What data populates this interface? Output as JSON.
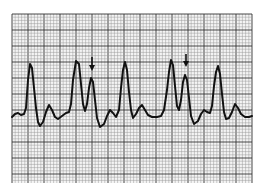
{
  "figure": {
    "paper_color": "#f4f4f4",
    "minor_grid_color": "#9a9a9a",
    "major_grid_color": "#333333",
    "trace_color": "#111111",
    "arrows": [
      {
        "x": 92,
        "y_top": 57,
        "y_tip": 71
      },
      {
        "x": 186,
        "y_top": 54,
        "y_tip": 67
      }
    ],
    "trace_points": [
      [
        12,
        117
      ],
      [
        15,
        114
      ],
      [
        18,
        113
      ],
      [
        21,
        115
      ],
      [
        24,
        114
      ],
      [
        26,
        108
      ],
      [
        28,
        80
      ],
      [
        30,
        64
      ],
      [
        32,
        68
      ],
      [
        34,
        88
      ],
      [
        36,
        108
      ],
      [
        38,
        122
      ],
      [
        40,
        126
      ],
      [
        43,
        122
      ],
      [
        46,
        112
      ],
      [
        49,
        105
      ],
      [
        52,
        110
      ],
      [
        55,
        117
      ],
      [
        58,
        119
      ],
      [
        62,
        116
      ],
      [
        66,
        113
      ],
      [
        69,
        112
      ],
      [
        71,
        104
      ],
      [
        73,
        80
      ],
      [
        76,
        61
      ],
      [
        79,
        64
      ],
      [
        81,
        84
      ],
      [
        83,
        104
      ],
      [
        85,
        111
      ],
      [
        87,
        104
      ],
      [
        89,
        88
      ],
      [
        91,
        78
      ],
      [
        93,
        82
      ],
      [
        95,
        100
      ],
      [
        97,
        118
      ],
      [
        100,
        127
      ],
      [
        104,
        124
      ],
      [
        107,
        116
      ],
      [
        110,
        110
      ],
      [
        113,
        113
      ],
      [
        116,
        117
      ],
      [
        119,
        110
      ],
      [
        121,
        88
      ],
      [
        123,
        70
      ],
      [
        125,
        62
      ],
      [
        127,
        70
      ],
      [
        129,
        92
      ],
      [
        131,
        110
      ],
      [
        133,
        118
      ],
      [
        136,
        114
      ],
      [
        139,
        108
      ],
      [
        142,
        105
      ],
      [
        145,
        110
      ],
      [
        148,
        115
      ],
      [
        152,
        117
      ],
      [
        157,
        117
      ],
      [
        161,
        116
      ],
      [
        164,
        110
      ],
      [
        167,
        90
      ],
      [
        169,
        72
      ],
      [
        171,
        60
      ],
      [
        173,
        65
      ],
      [
        175,
        86
      ],
      [
        177,
        106
      ],
      [
        179,
        110
      ],
      [
        181,
        100
      ],
      [
        183,
        82
      ],
      [
        185,
        75
      ],
      [
        187,
        80
      ],
      [
        189,
        98
      ],
      [
        191,
        116
      ],
      [
        194,
        124
      ],
      [
        198,
        121
      ],
      [
        201,
        114
      ],
      [
        204,
        110
      ],
      [
        207,
        112
      ],
      [
        210,
        113
      ],
      [
        212,
        106
      ],
      [
        214,
        86
      ],
      [
        216,
        72
      ],
      [
        218,
        66
      ],
      [
        220,
        74
      ],
      [
        222,
        94
      ],
      [
        224,
        112
      ],
      [
        226,
        119
      ],
      [
        229,
        118
      ],
      [
        232,
        112
      ],
      [
        235,
        104
      ],
      [
        238,
        108
      ],
      [
        241,
        114
      ],
      [
        245,
        117
      ],
      [
        249,
        117
      ],
      [
        252,
        116
      ]
    ]
  }
}
